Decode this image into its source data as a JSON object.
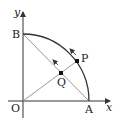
{
  "diagram": {
    "type": "geometry",
    "axes": {
      "x_label": "x",
      "y_label": "y"
    },
    "points": {
      "O": {
        "label": "O",
        "x": 23,
        "y": 101
      },
      "A": {
        "label": "A",
        "x": 89,
        "y": 101
      },
      "B": {
        "label": "B",
        "x": 23,
        "y": 34
      },
      "P": {
        "label": "P",
        "x": 77,
        "y": 61
      },
      "Q": {
        "label": "Q",
        "x": 61,
        "y": 73
      }
    },
    "segments": [
      "OP",
      "BA"
    ],
    "arc": "AB",
    "motion_arrows": [
      "P moves along arc toward B",
      "Q moves along chord toward B"
    ],
    "colors": {
      "line": "#999999",
      "arc": "#333333",
      "axis": "#333333",
      "point": "#111111"
    }
  }
}
